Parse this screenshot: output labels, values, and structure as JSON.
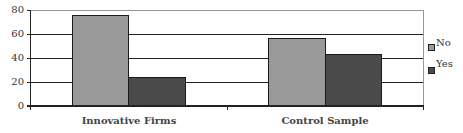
{
  "chart_data": {
    "type": "bar",
    "title": "",
    "xlabel": "",
    "ylabel": "",
    "categories": [
      "Innovative Firms",
      "Control Sample"
    ],
    "series": [
      {
        "name": "No",
        "values": [
          76,
          57
        ],
        "color": "#999999"
      },
      {
        "name": "Yes",
        "values": [
          24,
          43
        ],
        "color": "#4a4a4a"
      }
    ],
    "ylim": [
      0,
      80
    ],
    "yticks": [
      "0",
      "20",
      "40",
      "60",
      "80"
    ],
    "grid": true,
    "legend_position": "right"
  },
  "legend": {
    "items": [
      {
        "label": "No"
      },
      {
        "label": "Yes"
      }
    ]
  }
}
